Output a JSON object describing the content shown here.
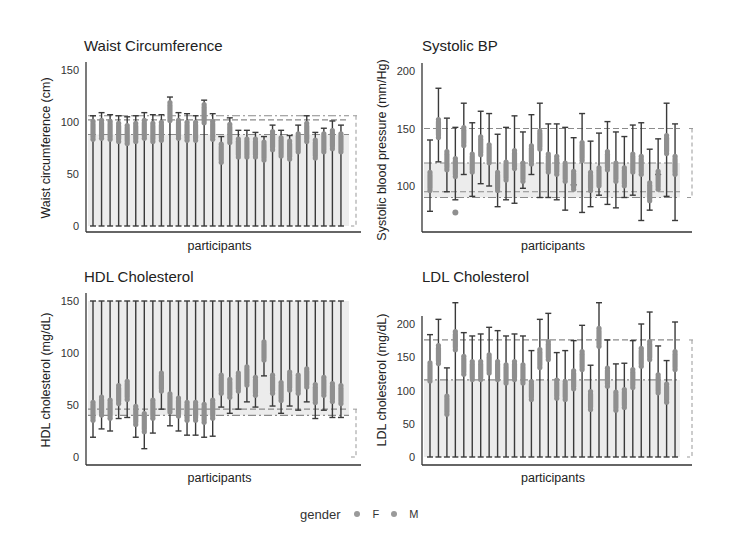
{
  "legend": {
    "title": "gender",
    "items": [
      {
        "label": "F",
        "color": "#9a9a9a"
      },
      {
        "label": "M",
        "color": "#9a9a9a"
      }
    ]
  },
  "colors": {
    "whisker": "#3a3a3a",
    "point": "#8f8f8f",
    "band": "#ececec",
    "refline": "#8a8a8a",
    "axis": "#333333"
  },
  "chart_data": [
    {
      "type": "box",
      "title": "Waist Circumference",
      "xlabel": "participants",
      "ylabel": "Waist circumference (cm)",
      "ylim": [
        0,
        150
      ],
      "yticks": [
        0,
        50,
        100,
        150
      ],
      "ref_lines": [
        88,
        102,
        106
      ],
      "normal_band": [
        0,
        88
      ],
      "participants": 30,
      "low": [
        0,
        0,
        0,
        0,
        0,
        0,
        0,
        0,
        0,
        0,
        0,
        0,
        0,
        0,
        0,
        0,
        0,
        0,
        0,
        0,
        0,
        0,
        0,
        0,
        0,
        0,
        0,
        0,
        0,
        0
      ],
      "high": [
        106,
        109,
        107,
        106,
        105,
        106,
        109,
        107,
        107,
        124,
        109,
        108,
        106,
        121,
        108,
        86,
        104,
        92,
        92,
        90,
        86,
        97,
        92,
        87,
        97,
        106,
        90,
        94,
        101,
        97
      ],
      "center": [
        92,
        93,
        92,
        90,
        88,
        90,
        93,
        90,
        91,
        110,
        93,
        91,
        91,
        108,
        92,
        70,
        89,
        75,
        75,
        75,
        72,
        82,
        76,
        73,
        80,
        90,
        74,
        80,
        83,
        80
      ]
    },
    {
      "type": "box",
      "title": "Systolic BP",
      "xlabel": "participants",
      "ylabel": "Systolic blood pressure (mm/Hg)",
      "ylim": [
        60,
        210
      ],
      "yticks": [
        100,
        150,
        200
      ],
      "ref_lines": [
        90,
        95,
        120,
        150
      ],
      "normal_band": [
        90,
        120
      ],
      "participants": 30,
      "outliers": [
        {
          "participant": 4,
          "value": 77
        }
      ],
      "low": [
        78,
        121,
        95,
        88,
        110,
        91,
        102,
        100,
        82,
        88,
        85,
        98,
        110,
        90,
        90,
        88,
        79,
        101,
        77,
        82,
        92,
        84,
        81,
        90,
        92,
        70,
        79,
        110,
        91,
        0
      ],
      "high": [
        140,
        185,
        159,
        151,
        172,
        155,
        165,
        163,
        145,
        151,
        161,
        147,
        162,
        172,
        154,
        154,
        151,
        142,
        163,
        139,
        146,
        156,
        147,
        143,
        153,
        155,
        132,
        141,
        172,
        154
      ],
      "center": [
        104,
        150,
        122,
        116,
        143,
        120,
        135,
        128,
        104,
        113,
        123,
        112,
        127,
        140,
        120,
        118,
        112,
        105,
        130,
        104,
        108,
        122,
        112,
        108,
        120,
        118,
        95,
        105,
        136,
        118
      ]
    },
    {
      "type": "box",
      "title": "HDL Cholesterol",
      "xlabel": "participants",
      "ylabel": "HDL cholesterol (mg/dL)",
      "ylim": [
        0,
        150
      ],
      "yticks": [
        0,
        50,
        100,
        150
      ],
      "ref_lines": [
        40,
        46
      ],
      "normal_band": [
        40,
        150
      ],
      "participants": 30,
      "low": [
        19,
        27,
        25,
        37,
        38,
        19,
        8,
        23,
        46,
        30,
        25,
        21,
        21,
        19,
        20,
        48,
        42,
        46,
        53,
        48,
        78,
        49,
        42,
        49,
        45,
        53,
        37,
        45,
        38,
        38
      ],
      "high": [
        150,
        150,
        150,
        150,
        150,
        150,
        150,
        150,
        150,
        150,
        150,
        150,
        150,
        150,
        150,
        150,
        150,
        150,
        150,
        150,
        150,
        150,
        150,
        150,
        150,
        150,
        150,
        150,
        150,
        150
      ],
      "center": [
        44,
        49,
        46,
        60,
        64,
        40,
        33,
        46,
        72,
        52,
        48,
        44,
        44,
        42,
        46,
        70,
        66,
        72,
        78,
        68,
        102,
        70,
        63,
        73,
        70,
        76,
        61,
        68,
        62,
        60
      ]
    },
    {
      "type": "box",
      "title": "LDL Cholesterol",
      "xlabel": "participants",
      "ylabel": "LDL cholesterol (mg/dL)",
      "ylim": [
        -10,
        240
      ],
      "yticks": [
        0,
        50,
        100,
        150,
        200
      ],
      "ref_lines": [
        116,
        176
      ],
      "normal_band": [
        0,
        116
      ],
      "participants": 30,
      "low": [
        0,
        0,
        0,
        0,
        0,
        0,
        0,
        0,
        0,
        0,
        0,
        0,
        0,
        0,
        0,
        0,
        0,
        0,
        0,
        0,
        0,
        0,
        0,
        0,
        0,
        0,
        0,
        0,
        0,
        0
      ],
      "high": [
        184,
        207,
        134,
        232,
        187,
        182,
        185,
        195,
        190,
        182,
        185,
        182,
        160,
        207,
        216,
        157,
        160,
        175,
        198,
        138,
        232,
        176,
        140,
        141,
        175,
        200,
        218,
        167,
        145,
        203
      ],
      "center": [
        128,
        154,
        78,
        175,
        138,
        130,
        130,
        140,
        130,
        125,
        130,
        125,
        100,
        148,
        160,
        102,
        100,
        116,
        145,
        85,
        180,
        120,
        84,
        88,
        118,
        150,
        160,
        110,
        96,
        145
      ]
    }
  ]
}
